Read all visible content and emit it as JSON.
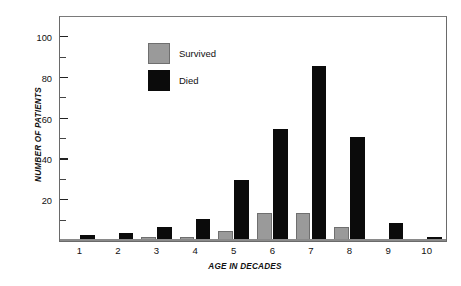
{
  "chart_data": {
    "type": "bar",
    "title": "",
    "xlabel": "AGE IN DECADES",
    "ylabel": "NUMBER OF PATIENTS",
    "categories": [
      "1",
      "2",
      "3",
      "4",
      "5",
      "6",
      "7",
      "8",
      "9",
      "10"
    ],
    "series": [
      {
        "name": "Survived",
        "color": "#9a9a9a",
        "values": [
          0,
          0,
          2,
          2,
          5,
          14,
          14,
          7,
          1,
          0
        ]
      },
      {
        "name": "Died",
        "color": "#0b0b0b",
        "values": [
          3,
          4,
          7,
          11,
          30,
          55,
          86,
          51,
          9,
          2
        ]
      }
    ],
    "ylim": [
      0,
      110
    ],
    "yticks_major": [
      20,
      40,
      60,
      80,
      100
    ],
    "yticks_minor": [
      10,
      30,
      50,
      70,
      90
    ],
    "ytick_labels": [
      "20",
      "40",
      "60",
      "80",
      "100"
    ],
    "grid": false,
    "legend_position": "top-left",
    "legend_entries": [
      "Survived",
      "Died"
    ]
  },
  "axes": {
    "y_title": "NUMBER OF PATIENTS",
    "x_title": "AGE IN DECADES"
  },
  "legend": {
    "survived_label": "Survived",
    "died_label": "Died"
  }
}
